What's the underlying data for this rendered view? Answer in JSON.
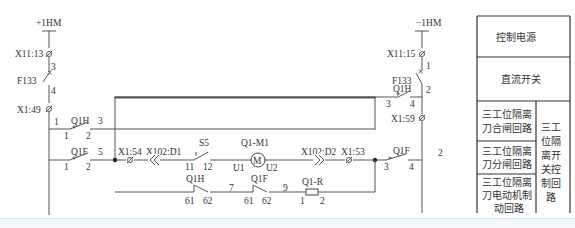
{
  "diagram": {
    "power": {
      "positive": "+1HM",
      "negative": "−1HM"
    },
    "left_rail": {
      "terminal_top": "X11:13",
      "breaker": "F133",
      "breaker_pins": [
        "3",
        "4"
      ],
      "terminal_bottom": "X1:49"
    },
    "right_rail": {
      "terminal_top": "X11:15",
      "breaker": "F133",
      "breaker_pins": [
        "1",
        "2"
      ],
      "terminal_bottom": "X1:59"
    },
    "contacts": {
      "q1h_close": {
        "name": "Q1H",
        "pins": [
          "1",
          "2"
        ],
        "node_left": "1",
        "node_right": "3"
      },
      "q1f_open": {
        "name": "Q1F",
        "pins": [
          "1",
          "2"
        ],
        "node_right": "5"
      },
      "q1h_right": {
        "name": "Q1H",
        "pins": [
          "3",
          "4"
        ]
      },
      "q1f_right": {
        "name": "Q1F",
        "pins": [
          "3",
          "4"
        ],
        "node_right": "2"
      },
      "s5": {
        "name": "S5",
        "pins": [
          "11",
          "12"
        ]
      },
      "q1h_brake": {
        "name": "Q1H",
        "pins": [
          "61",
          "62"
        ]
      },
      "q1f_brake": {
        "name": "Q1F",
        "pins": [
          "61",
          "62"
        ],
        "node_left": "7",
        "node_right": "9"
      }
    },
    "terminals": {
      "x1_54": "X1:54",
      "x102_d1": "X102:D1",
      "x102_d2": "X102:D2",
      "x1_53": "X1:53"
    },
    "motor": {
      "name": "Q1-M1",
      "symbol": "M",
      "pins": [
        "U1",
        "U2"
      ]
    },
    "resistor": {
      "name": "Q1-R",
      "pins": [
        "1",
        "2"
      ]
    }
  },
  "legend_table": {
    "rows": [
      {
        "label": "控制电源"
      },
      {
        "label": "直流开关"
      }
    ],
    "group": {
      "label": "三工位隔离开关控制回路",
      "label_lines": [
        "三工",
        "位隔",
        "离开",
        "关控",
        "制回",
        "路"
      ],
      "items": [
        {
          "lines": [
            "三工位隔离",
            "刀合闸回路"
          ]
        },
        {
          "lines": [
            "三工位隔离",
            "刀分闸回路"
          ]
        },
        {
          "lines": [
            "三工位隔离",
            "刀电动机制",
            "动回路"
          ]
        }
      ]
    }
  }
}
